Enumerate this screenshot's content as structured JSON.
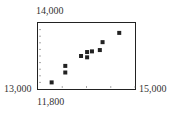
{
  "chart_data": {
    "type": "scatter",
    "title": "",
    "xlabel": "",
    "ylabel": "",
    "xlim": [
      11800,
      15000
    ],
    "ylim": [
      13000,
      14000
    ],
    "x_ticks_step": 800,
    "y_ticks_step": 100,
    "grid": false,
    "axis_labels": {
      "y_max": "14,000",
      "y_min": "13,000",
      "x_min": "11,800",
      "x_max": "15,000"
    },
    "points": [
      {
        "x": 12250,
        "y": 13100
      },
      {
        "x": 12700,
        "y": 13250
      },
      {
        "x": 12700,
        "y": 13350
      },
      {
        "x": 13220,
        "y": 13500
      },
      {
        "x": 13420,
        "y": 13480
      },
      {
        "x": 13420,
        "y": 13560
      },
      {
        "x": 13580,
        "y": 13570
      },
      {
        "x": 13840,
        "y": 13590
      },
      {
        "x": 13930,
        "y": 13710
      },
      {
        "x": 14480,
        "y": 13850
      }
    ],
    "marker": "square",
    "color": "#222222"
  }
}
